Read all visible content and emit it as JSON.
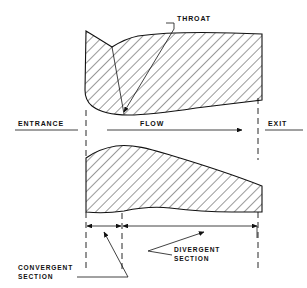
{
  "diagram": {
    "background_color": "#ffffff",
    "line_color": "#111111",
    "labels": {
      "throat": "THROAT",
      "entrance": "ENTRANCE",
      "flow": "FLOW",
      "exit": "EXIT",
      "convergent_line1": "CONVERGENT",
      "convergent_line2": "SECTION",
      "divergent_line1": "DIVERGENT",
      "divergent_line2": "SECTION"
    },
    "icons": {
      "flow_arrow": "arrow-right-icon",
      "throat_pointer": "leader-arrow-icon",
      "convergent_pointer": "leader-arrow-icon",
      "divergent_pointer": "leader-arrow-icon",
      "dimension_convergent": "double-arrow-icon",
      "dimension_divergent": "double-arrow-icon"
    },
    "station_lines": {
      "entrance_x": 86,
      "throat_x": 122,
      "exit_x": 258
    },
    "sections": [
      {
        "name": "convergent",
        "start_x": 86,
        "end_x": 122
      },
      {
        "name": "divergent",
        "start_x": 122,
        "end_x": 258
      }
    ]
  }
}
